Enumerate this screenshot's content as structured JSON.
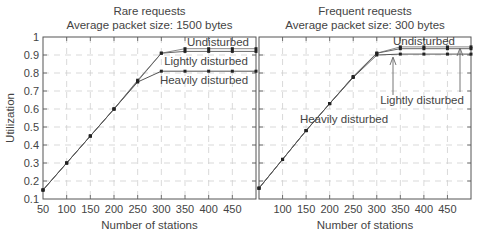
{
  "chart_data": [
    {
      "type": "line",
      "title": "Rare requests",
      "subtitle": "Average packet size: 1500 bytes",
      "xlabel": "Number of stations",
      "ylabel": "Utilization",
      "xlim": [
        50,
        500
      ],
      "ylim": [
        0.1,
        1.0
      ],
      "xticks": [
        50,
        100,
        150,
        200,
        250,
        300,
        350,
        400,
        450
      ],
      "yticks": [
        0.1,
        0.2,
        0.3,
        0.4,
        0.5,
        0.6,
        0.7,
        0.8,
        0.9,
        1
      ],
      "grid": true,
      "x": [
        50,
        100,
        150,
        200,
        250,
        300,
        350,
        400,
        450,
        500
      ],
      "series": [
        {
          "name": "Undisturbed",
          "values": [
            0.15,
            0.3,
            0.45,
            0.6,
            0.76,
            0.91,
            0.935,
            0.935,
            0.935,
            0.935
          ]
        },
        {
          "name": "Lightly disturbed",
          "values": [
            0.15,
            0.3,
            0.45,
            0.6,
            0.755,
            0.91,
            0.92,
            0.92,
            0.92,
            0.92
          ]
        },
        {
          "name": "Heavily disturbed",
          "values": [
            0.15,
            0.3,
            0.45,
            0.6,
            0.75,
            0.81,
            0.81,
            0.81,
            0.81,
            0.81
          ]
        }
      ],
      "annotations": [
        "Undisturbed",
        "Lightly disturbed",
        "Heavily disturbed"
      ]
    },
    {
      "type": "line",
      "title": "Frequent requests",
      "subtitle": "Average packet size: 300 bytes",
      "xlabel": "Number of stations",
      "ylabel": "",
      "xlim": [
        50,
        500
      ],
      "ylim": [
        0.1,
        1.0
      ],
      "xticks": [
        100,
        150,
        200,
        250,
        300,
        350,
        400,
        450
      ],
      "grid": true,
      "x": [
        50,
        100,
        150,
        200,
        250,
        300,
        350,
        400,
        450,
        500
      ],
      "series": [
        {
          "name": "Undisturbed",
          "values": [
            0.16,
            0.32,
            0.48,
            0.63,
            0.78,
            0.91,
            0.945,
            0.945,
            0.945,
            0.945
          ]
        },
        {
          "name": "Lightly disturbed",
          "values": [
            0.16,
            0.32,
            0.48,
            0.63,
            0.78,
            0.91,
            0.935,
            0.935,
            0.935,
            0.935
          ]
        },
        {
          "name": "Heavily disturbed",
          "values": [
            0.16,
            0.32,
            0.48,
            0.63,
            0.775,
            0.9,
            0.905,
            0.905,
            0.905,
            0.905
          ]
        }
      ],
      "annotations": [
        "Undisturbed",
        "Lightly disturbed",
        "Heavily disturbed"
      ]
    }
  ]
}
